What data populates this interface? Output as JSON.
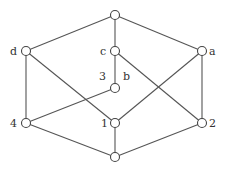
{
  "diagram": {
    "type": "lattice / Hasse diagram",
    "nodes": [
      {
        "id": "top",
        "x": 115,
        "y": 15,
        "label": "",
        "lx": 0,
        "ly": 0
      },
      {
        "id": "d",
        "x": 26,
        "y": 51,
        "label": "d",
        "lx": 10,
        "ly": 55
      },
      {
        "id": "c",
        "x": 115,
        "y": 51,
        "label": "c",
        "lx": 100,
        "ly": 55
      },
      {
        "id": "a",
        "x": 202,
        "y": 51,
        "label": "a",
        "lx": 209,
        "ly": 55
      },
      {
        "id": "mid",
        "x": 115,
        "y": 88,
        "label": "",
        "lx": 0,
        "ly": 0
      },
      {
        "id": "4",
        "x": 26,
        "y": 123,
        "label": "4",
        "lx": 10,
        "ly": 127
      },
      {
        "id": "1",
        "x": 115,
        "y": 123,
        "label": "1",
        "lx": 101,
        "ly": 127
      },
      {
        "id": "2",
        "x": 202,
        "y": 123,
        "label": "2",
        "lx": 209,
        "ly": 127
      },
      {
        "id": "bottom",
        "x": 115,
        "y": 157,
        "label": "",
        "lx": 0,
        "ly": 0
      }
    ],
    "extra_labels": [
      {
        "text": "3",
        "x": 99,
        "y": 80
      },
      {
        "text": "b",
        "x": 123,
        "y": 80
      }
    ],
    "edges": [
      [
        "top",
        "d"
      ],
      [
        "top",
        "c"
      ],
      [
        "top",
        "a"
      ],
      [
        "d",
        "4"
      ],
      [
        "d",
        "1"
      ],
      [
        "c",
        "mid"
      ],
      [
        "c",
        "2"
      ],
      [
        "a",
        "1"
      ],
      [
        "a",
        "2"
      ],
      [
        "mid",
        "4"
      ],
      [
        "4",
        "bottom"
      ],
      [
        "1",
        "bottom"
      ],
      [
        "2",
        "bottom"
      ]
    ],
    "colors": {
      "stroke": "#555555",
      "node_fill": "#ffffff",
      "text": "#333333"
    }
  }
}
